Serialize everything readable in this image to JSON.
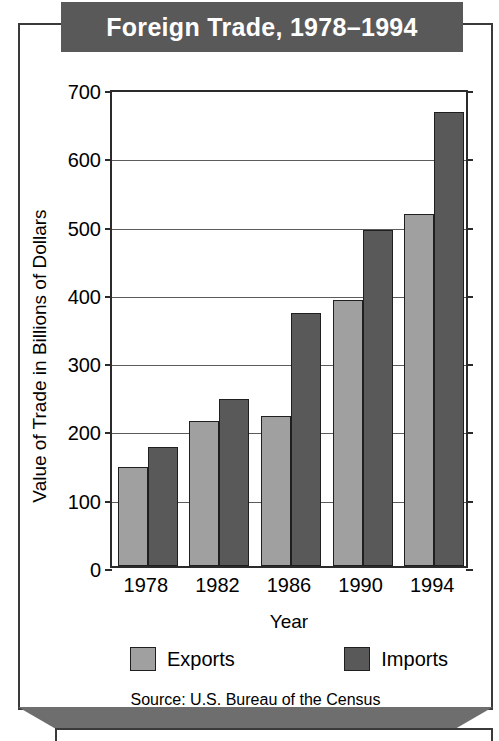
{
  "title": "Foreign Trade, 1978–1994",
  "source": "Source:  U.S. Bureau of the Census",
  "chart_data": {
    "type": "bar",
    "title": "Foreign Trade, 1978–1994",
    "subtitle": "",
    "xlabel": "Year",
    "ylabel": "Value of Trade in Billions of Dollars",
    "categories": [
      "1978",
      "1982",
      "1986",
      "1990",
      "1994"
    ],
    "series": [
      {
        "name": "Exports",
        "color": "#a0a0a0",
        "values": [
          145,
          212,
          220,
          390,
          515
        ]
      },
      {
        "name": "Imports",
        "color": "#595959",
        "values": [
          175,
          244,
          370,
          492,
          665
        ]
      }
    ],
    "ylim": [
      0,
      700
    ],
    "ytick_values": [
      0,
      100,
      200,
      300,
      400,
      500,
      600,
      700
    ],
    "ytick_labels": [
      "0",
      "100",
      "200",
      "300",
      "400",
      "500",
      "600",
      "700"
    ],
    "grid": true,
    "legend_position": "bottom",
    "annotations": [
      "Source:  U.S. Bureau of the Census"
    ]
  },
  "colors": {
    "banner_background": "#595959",
    "banner_text": "#ffffff",
    "exports": "#a0a0a0",
    "imports": "#595959",
    "frame": "#3a3a3a",
    "axis": "#2b2b2b",
    "gridline": "#5c5c5c"
  }
}
